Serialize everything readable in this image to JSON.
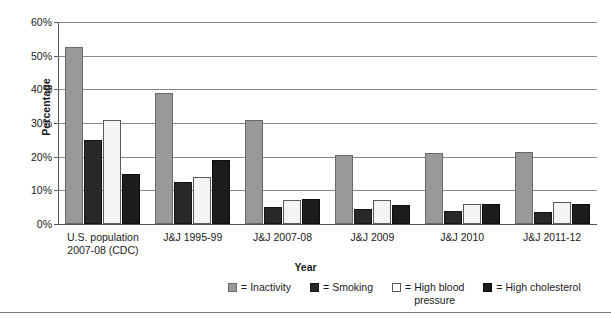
{
  "chart_data": {
    "type": "bar",
    "title": "",
    "xlabel": "Year",
    "ylabel": "Percentage",
    "ylim": [
      0,
      60
    ],
    "ytick_labels": [
      "0%",
      "10%",
      "20%",
      "30%",
      "40%",
      "50%",
      "60%"
    ],
    "ytick_values": [
      0,
      10,
      20,
      30,
      40,
      50,
      60
    ],
    "grid": true,
    "legend_position": "bottom",
    "categories": [
      "U.S. population\n2007-08 (CDC)",
      "J&J 1995-99",
      "J&J 2007-08",
      "J&J 2009",
      "J&J 2010",
      "J&J 2011-12"
    ],
    "category_lines": [
      [
        "U.S. population",
        "2007-08 (CDC)"
      ],
      [
        "J&J 1995-99"
      ],
      [
        "J&J 2007-08"
      ],
      [
        "J&J 2009"
      ],
      [
        "J&J 2010"
      ],
      [
        "J&J 2011-12"
      ]
    ],
    "series": [
      {
        "name": "Inactivity",
        "color": "#999999",
        "values": [
          52.5,
          39.0,
          31.0,
          20.5,
          21.0,
          21.5
        ]
      },
      {
        "name": "Smoking",
        "color": "#282828",
        "values": [
          25.0,
          12.5,
          5.0,
          4.5,
          4.0,
          3.5
        ]
      },
      {
        "name": "High blood pressure",
        "color": "#f3f3f3",
        "values": [
          31.0,
          14.0,
          7.0,
          7.0,
          6.0,
          6.5
        ]
      },
      {
        "name": "High cholesterol",
        "color": "#1c1c1c",
        "values": [
          15.0,
          19.0,
          7.5,
          5.5,
          6.0,
          6.0
        ]
      }
    ]
  },
  "legend": {
    "items": [
      {
        "equals": "=",
        "label": "Inactivity",
        "swatch": "inactivity"
      },
      {
        "equals": "=",
        "label": "Smoking",
        "swatch": "smoking"
      },
      {
        "equals": "=",
        "label": "High blood\npressure",
        "swatch": "hbp"
      },
      {
        "equals": "=",
        "label": "High cholesterol",
        "swatch": "cholesterol"
      }
    ]
  },
  "axes": {
    "y_title": "Percentage",
    "x_title": "Year"
  }
}
